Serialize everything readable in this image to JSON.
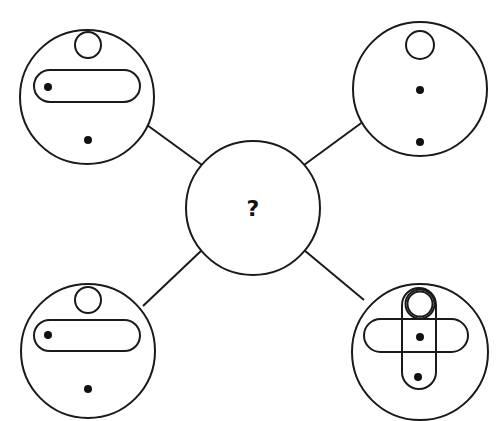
{
  "puzzle": {
    "center_label": "?",
    "stroke_color": "#1a1a1a",
    "fill_dot_color": "#111111",
    "background": "#ffffff",
    "connectors": [
      {
        "from": "top-left",
        "to": "center",
        "x1": 147,
        "y1": 125,
        "x2": 202,
        "y2": 165
      },
      {
        "from": "top-right",
        "to": "center",
        "x1": 364,
        "y1": 121,
        "x2": 304,
        "y2": 165
      },
      {
        "from": "bottom-left",
        "to": "center",
        "x1": 143,
        "y1": 306,
        "x2": 202,
        "y2": 250
      },
      {
        "from": "bottom-right",
        "to": "center",
        "x1": 364,
        "y1": 300,
        "x2": 304,
        "y2": 250
      }
    ],
    "panels": [
      {
        "id": "top-left",
        "circle": {
          "cx": 87,
          "cy": 97,
          "r": 67
        },
        "elements": [
          "small-ring-top",
          "horizontal-pill",
          "dot-in-pill-left",
          "dot-bottom"
        ]
      },
      {
        "id": "top-right",
        "circle": {
          "cx": 420,
          "cy": 89,
          "r": 67
        },
        "elements": [
          "small-ring-top",
          "dot-center",
          "dot-bottom"
        ]
      },
      {
        "id": "center",
        "circle": {
          "cx": 253,
          "cy": 208,
          "r": 67
        },
        "elements": [
          "question-mark"
        ]
      },
      {
        "id": "bottom-left",
        "circle": {
          "cx": 88,
          "cy": 351,
          "r": 67
        },
        "elements": [
          "small-ring-top",
          "horizontal-pill",
          "dot-in-pill-left",
          "dot-bottom"
        ]
      },
      {
        "id": "bottom-right",
        "circle": {
          "cx": 420,
          "cy": 352,
          "r": 68
        },
        "elements": [
          "horizontal-pill",
          "vertical-pill",
          "double-ring-top",
          "dot-center",
          "dot-bottom"
        ]
      }
    ]
  }
}
